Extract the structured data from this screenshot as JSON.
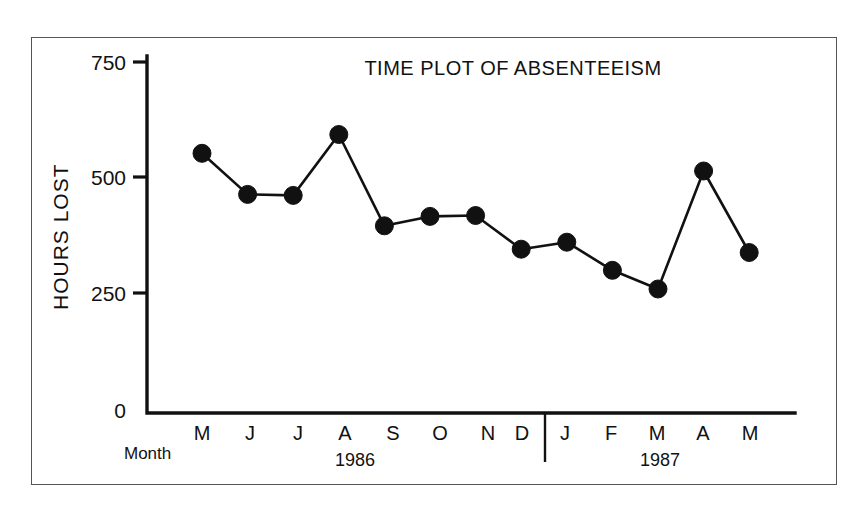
{
  "figure": {
    "title": "TIME PLOT OF ABSENTEEISM",
    "month_caption": "Month",
    "background_color": "#ffffff",
    "ink_color": "#111111",
    "frame_color": "#555555"
  },
  "axes": {
    "y_title": "HOURS LOST",
    "y_ticks": [
      "0",
      "250",
      "500",
      "750"
    ],
    "x_months": [
      "M",
      "J",
      "J",
      "A",
      "S",
      "O",
      "N",
      "D",
      "J",
      "F",
      "M",
      "A",
      "M"
    ],
    "x_years": [
      "1986",
      "1987"
    ]
  },
  "chart_data": {
    "type": "line",
    "title": "TIME PLOT OF ABSENTEEISM",
    "xlabel": "Month",
    "ylabel": "HOURS LOST",
    "ylim": [
      0,
      750
    ],
    "ytick_values": [
      0,
      250,
      500,
      750
    ],
    "grid": false,
    "legend": "none",
    "marker": "filled-circle",
    "categories": [
      "M 1986",
      "J 1986",
      "J 1986",
      "A 1986",
      "S 1986",
      "O 1986",
      "N 1986",
      "D 1986",
      "J 1987",
      "F 1987",
      "M 1987",
      "A 1987",
      "M 1987"
    ],
    "month_labels": [
      "M",
      "J",
      "J",
      "A",
      "S",
      "O",
      "N",
      "D",
      "J",
      "F",
      "M",
      "A",
      "M"
    ],
    "year_groups": [
      {
        "year": "1986",
        "months": [
          "M",
          "J",
          "J",
          "A",
          "S",
          "O",
          "N",
          "D"
        ]
      },
      {
        "year": "1987",
        "months": [
          "J",
          "F",
          "M",
          "A",
          "M"
        ]
      }
    ],
    "values": [
      555,
      467,
      465,
      595,
      400,
      420,
      422,
      350,
      365,
      305,
      265,
      517,
      343
    ],
    "series": [
      {
        "name": "Hours lost",
        "values": [
          555,
          467,
          465,
          595,
          400,
          420,
          422,
          350,
          365,
          305,
          265,
          517,
          343
        ]
      }
    ]
  }
}
